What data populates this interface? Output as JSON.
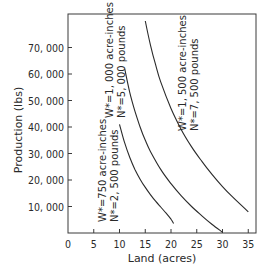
{
  "chart_data": {
    "type": "line",
    "title": "",
    "xlabel": "Land (acres)",
    "ylabel": "Production (lbs)",
    "xlim": [
      0,
      36.5
    ],
    "ylim": [
      0,
      83000
    ],
    "grid": false,
    "legend": "none (inline curve annotations)",
    "x_ticks": [
      0,
      5,
      10,
      15,
      20,
      25,
      30,
      35
    ],
    "x_tick_labels": [
      "0",
      "5",
      "10",
      "15",
      "20",
      "25",
      "30",
      "35"
    ],
    "y_ticks": [
      10000,
      20000,
      30000,
      40000,
      50000,
      60000,
      70000
    ],
    "y_tick_labels": [
      "10, 000",
      "20, 000",
      "30, 000",
      "40, 000",
      "50, 000",
      "60, 000",
      "70, 000"
    ],
    "series": [
      {
        "name": "W*=750 acre-inches, N*=2,500 pounds",
        "label_line1": "W*=750 acre-inches",
        "label_line2": "N*=2, 500 pounds",
        "x": [
          10,
          11,
          12,
          13,
          14,
          15,
          16,
          17,
          18,
          19,
          20,
          20.5
        ],
        "y": [
          41000,
          34000,
          28500,
          24000,
          20300,
          17200,
          14500,
          12000,
          9800,
          7600,
          5200,
          3600
        ]
      },
      {
        "name": "W*=1,000 acre-inches, N*=5,000 pounds",
        "label_line1": "W*=1, 000 acre-inches",
        "label_line2": "N*=5, 000 pounds",
        "x": [
          11,
          12,
          13,
          14,
          15,
          16,
          18,
          20,
          22,
          24,
          26,
          28,
          30
        ],
        "y": [
          62000,
          53000,
          46000,
          40000,
          35000,
          30800,
          24000,
          18600,
          14000,
          10000,
          6500,
          3200,
          300
        ]
      },
      {
        "name": "W*=1,500 acre-inches, N*=7,500 pounds",
        "label_line1": "W*=1, 500 acre-inches",
        "label_line2": "N*=7, 500 pounds",
        "x": [
          15,
          16,
          17,
          18,
          20,
          22,
          24,
          26,
          28,
          30,
          32,
          35
        ],
        "y": [
          80000,
          71000,
          63500,
          57000,
          47000,
          39000,
          32500,
          27000,
          22000,
          17500,
          13500,
          8000
        ]
      }
    ]
  }
}
